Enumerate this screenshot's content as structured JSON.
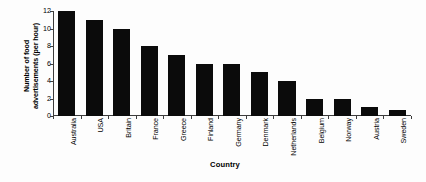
{
  "chart_data": {
    "type": "bar",
    "title": "",
    "xlabel": "Country",
    "ylabel": "Number of food advertisements (per hour)",
    "ylabel_lines": [
      "Number of food",
      "advertisements (per hour)"
    ],
    "categories": [
      "Australia",
      "USA",
      "Britain",
      "France",
      "Greece",
      "Finland",
      "Germany",
      "Denmark",
      "Netherlands",
      "Belgium",
      "Norway",
      "Austria",
      "Sweden"
    ],
    "values": [
      12,
      11,
      10,
      8,
      7,
      6,
      6,
      5,
      4,
      2,
      2,
      1,
      0.7
    ],
    "ylim": [
      0,
      12
    ],
    "yticks": [
      0,
      2,
      4,
      6,
      8,
      10,
      12
    ],
    "ytick_labels": [
      "0",
      "2",
      "4",
      "6",
      "8",
      "10",
      "12"
    ],
    "grid": false,
    "legend": "none",
    "bar_color": "#0b0b0b",
    "axis_color": "#3d3d3d",
    "background_color": "#fdfdfd"
  }
}
